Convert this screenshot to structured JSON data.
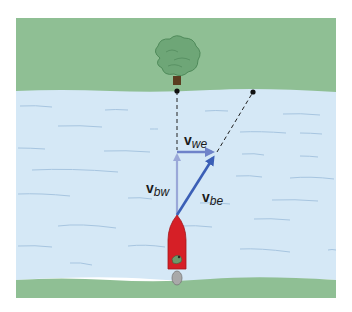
{
  "diagram": {
    "colors": {
      "bank": "#8fbf94",
      "water": "#d5e8f6",
      "wave": "#a7c5e0",
      "arrow_light": "#9aa8d8",
      "arrow_dark": "#3b5fb6",
      "boat": "#d61f26",
      "tree": "#5f9a6a",
      "trunk": "#5a3d20",
      "motor": "#a9a9a9"
    },
    "labels": {
      "v_we": {
        "main": "v",
        "sub": "we"
      },
      "v_bw": {
        "main": "v",
        "sub": "bw"
      },
      "v_be": {
        "main": "v",
        "sub": "be"
      }
    },
    "vectors": [
      {
        "name": "v_bw",
        "from": [
          177,
          215
        ],
        "to": [
          177,
          151
        ],
        "meaning": "velocity of boat relative to water"
      },
      {
        "name": "v_we",
        "from": [
          177,
          152
        ],
        "to": [
          217,
          152
        ],
        "meaning": "velocity of water relative to earth"
      },
      {
        "name": "v_be",
        "from": [
          177,
          215
        ],
        "to": [
          217,
          152
        ],
        "meaning": "velocity of boat relative to earth"
      }
    ],
    "points": [
      {
        "name": "target-point-opposite-tree",
        "at": [
          177,
          91
        ]
      },
      {
        "name": "actual-landing-point",
        "at": [
          253,
          92
        ]
      }
    ]
  }
}
